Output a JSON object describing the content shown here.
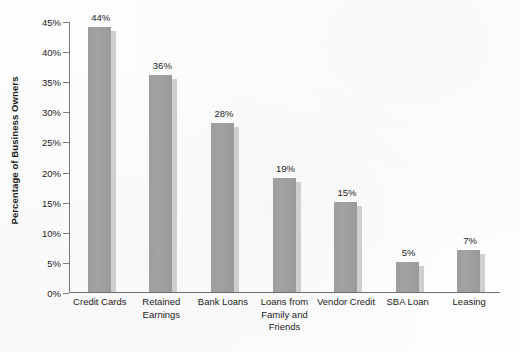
{
  "chart_data": {
    "type": "bar",
    "title": "",
    "subtitle": "",
    "xlabel": "",
    "ylabel": "Percentage of Business Owners",
    "ylim": [
      0,
      45
    ],
    "ytick_step": 5,
    "ytick_labels": [
      "45%",
      "40%",
      "35%",
      "30%",
      "25%",
      "20%",
      "15%",
      "10%",
      "5%",
      "0%"
    ],
    "ytick_values": [
      45,
      40,
      35,
      30,
      25,
      20,
      15,
      10,
      5,
      0
    ],
    "grid": false,
    "legend": "none",
    "categories": [
      "Credit Cards",
      "Retained Earnings",
      "Bank Loans",
      "Loans from Family and Friends",
      "Vendor Credit",
      "SBA Loan",
      "Leasing"
    ],
    "category_lines": [
      [
        "Credit Cards"
      ],
      [
        "Retained",
        "Earnings"
      ],
      [
        "Bank Loans"
      ],
      [
        "Loans from",
        "Family and",
        "Friends"
      ],
      [
        "Vendor Credit"
      ],
      [
        "SBA Loan"
      ],
      [
        "Leasing"
      ]
    ],
    "values": [
      44,
      36,
      28,
      19,
      15,
      5,
      7
    ],
    "data_labels": [
      "44%",
      "36%",
      "28%",
      "19%",
      "15%",
      "5%",
      "7%"
    ],
    "colors": {
      "bar_fill": "#9fa09f",
      "bar_shadow": "#cfcfcf",
      "axis": "#7c7c7c",
      "text": "#1c1c1c",
      "background": "#fdfdfd"
    }
  }
}
